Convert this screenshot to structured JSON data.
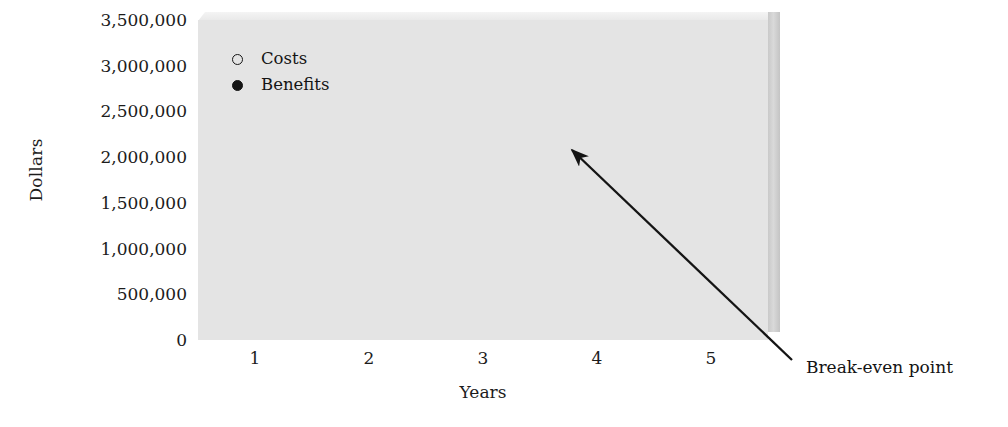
{
  "chart_data": {
    "type": "line",
    "title": "",
    "xlabel": "Years",
    "ylabel": "Dollars",
    "x": [
      1,
      2,
      3,
      4,
      5
    ],
    "xtick_labels": [
      "1",
      "2",
      "3",
      "4",
      "5"
    ],
    "ytick_labels": [
      "3,500,000",
      "3,000,000",
      "2,500,000",
      "2,000,000",
      "1,500,000",
      "1,000,000",
      "500,000",
      "0"
    ],
    "ytick_values": [
      3500000,
      3000000,
      2500000,
      2000000,
      1500000,
      1000000,
      500000,
      0
    ],
    "ylim": [
      0,
      3500000
    ],
    "xlim": [
      0.5,
      5.5
    ],
    "grid": true,
    "legend_position": "upper-left-inside",
    "series": [
      {
        "name": "Costs",
        "marker": "open-circle",
        "color": "#151515",
        "values": [
          1760000,
          1960000,
          2170000,
          2370000,
          2580000
        ]
      },
      {
        "name": "Benefits",
        "marker": "filled-circle",
        "color": "#151515",
        "values": [
          560000,
          1230000,
          1900000,
          2560000,
          3220000
        ]
      }
    ],
    "annotations": [
      {
        "label": "Break-even point",
        "type": "arrow",
        "points_to_x": 3.55,
        "points_to_y": 2280000
      }
    ]
  },
  "legend": {
    "items": [
      {
        "label": "Costs",
        "marker": "open-circle"
      },
      {
        "label": "Benefits",
        "marker": "filled-circle"
      }
    ]
  },
  "axes": {
    "y_title": "Dollars",
    "x_title": "Years"
  },
  "colors": {
    "plot_background": "#e4e4e4",
    "gridline": "#fbfbfb",
    "series_ink": "#151515",
    "page_background": "#ffffff",
    "wall_shadow": "#c9c9c9"
  }
}
